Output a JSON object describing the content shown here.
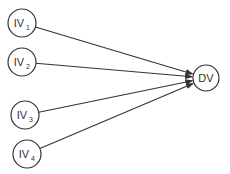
{
  "diagram": {
    "type": "path-diagram",
    "line_color": "#333333",
    "sources": [
      {
        "id": "iv1",
        "label": "IV",
        "subscript": "1"
      },
      {
        "id": "iv2",
        "label": "IV",
        "subscript": "2"
      },
      {
        "id": "iv3",
        "label": "IV",
        "subscript": "3"
      },
      {
        "id": "iv4",
        "label": "IV",
        "subscript": "4"
      }
    ],
    "target": {
      "id": "dv",
      "label": "DV"
    },
    "edges": [
      {
        "from": "iv1",
        "to": "dv"
      },
      {
        "from": "iv2",
        "to": "dv"
      },
      {
        "from": "iv3",
        "to": "dv"
      },
      {
        "from": "iv4",
        "to": "dv"
      }
    ]
  }
}
